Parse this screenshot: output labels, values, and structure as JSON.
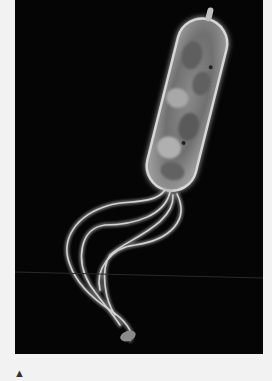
{
  "figure": {
    "background_color": "#050505",
    "page_color": "#f2f2f2"
  },
  "caption": {
    "marker": "▲",
    "text": ""
  }
}
